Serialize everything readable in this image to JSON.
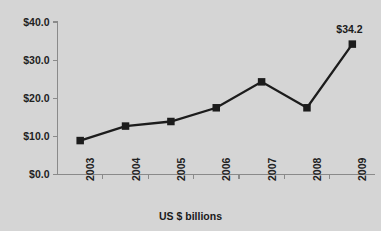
{
  "chart_data": {
    "type": "line",
    "title": "",
    "subtitle": "",
    "xlabel": "US $ billions",
    "ylabel": "",
    "categories": [
      "2003",
      "2004",
      "2005",
      "2006",
      "2007",
      "2008",
      "2009"
    ],
    "values": [
      8.9,
      12.7,
      13.9,
      17.5,
      24.3,
      17.5,
      34.2
    ],
    "series": [
      {
        "name": "US $ billions",
        "values": [
          8.9,
          12.7,
          13.9,
          17.5,
          24.3,
          17.5,
          34.2
        ]
      }
    ],
    "ylim": [
      0.0,
      40.0
    ],
    "ytick_values": [
      0.0,
      10.0,
      20.0,
      30.0,
      40.0
    ],
    "ytick_labels": [
      "$0.0",
      "$10.0",
      "$20.0",
      "$30.0",
      "$40.0"
    ],
    "xtick_labels": [
      "2003",
      "2004",
      "2005",
      "2006",
      "2007",
      "2008",
      "2009"
    ],
    "data_labels": [
      {
        "category": "2009",
        "value": 34.2,
        "text": "$34.2"
      }
    ],
    "grid": false,
    "legend": false,
    "legend_position": "none",
    "marker": "square",
    "xtick_label_rotation": -90,
    "colors": {
      "background": "#d5d5d5",
      "series_line": "#1c1c1c",
      "marker": "#1c1c1c",
      "axis": "#8a8a8a",
      "text": "#222222"
    }
  }
}
